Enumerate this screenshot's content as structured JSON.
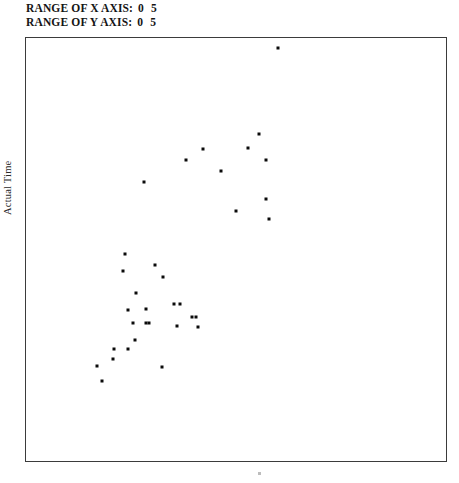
{
  "header": {
    "x_range": {
      "label": "RANGE OF X AXIS:",
      "min": "0",
      "max": "5"
    },
    "y_range": {
      "label": "RANGE OF Y AXIS:",
      "min": "0",
      "max": "5"
    }
  },
  "axes": {
    "y_title": "Actual Time",
    "x_title": ""
  },
  "chart_data": {
    "type": "scatter",
    "title": "",
    "xlabel": "",
    "ylabel": "Actual Time",
    "xlim": [
      0,
      5
    ],
    "ylim": [
      0,
      5
    ],
    "grid": false,
    "legend": null,
    "marker": {
      "shape": "square",
      "size_px": 3,
      "color": "#0b0b0b"
    },
    "n_points": 34,
    "points": [
      {
        "x": 3.0,
        "y": 4.88
      },
      {
        "x": 2.77,
        "y": 3.86
      },
      {
        "x": 2.64,
        "y": 3.7
      },
      {
        "x": 2.11,
        "y": 3.69
      },
      {
        "x": 2.86,
        "y": 3.56
      },
      {
        "x": 1.9,
        "y": 3.56
      },
      {
        "x": 2.32,
        "y": 3.43
      },
      {
        "x": 1.4,
        "y": 3.3
      },
      {
        "x": 2.86,
        "y": 3.1
      },
      {
        "x": 2.5,
        "y": 2.95
      },
      {
        "x": 2.89,
        "y": 2.86
      },
      {
        "x": 1.54,
        "y": 2.32
      },
      {
        "x": 1.15,
        "y": 2.25
      },
      {
        "x": 1.63,
        "y": 2.18
      },
      {
        "x": 1.31,
        "y": 1.98
      },
      {
        "x": 1.76,
        "y": 1.85
      },
      {
        "x": 1.83,
        "y": 1.85
      },
      {
        "x": 1.43,
        "y": 1.8
      },
      {
        "x": 1.98,
        "y": 1.7
      },
      {
        "x": 2.02,
        "y": 1.7
      },
      {
        "x": 1.27,
        "y": 1.63
      },
      {
        "x": 1.43,
        "y": 1.63
      },
      {
        "x": 1.47,
        "y": 1.63
      },
      {
        "x": 1.8,
        "y": 1.6
      },
      {
        "x": 2.05,
        "y": 1.58
      },
      {
        "x": 1.3,
        "y": 1.43
      },
      {
        "x": 1.05,
        "y": 1.32
      },
      {
        "x": 1.22,
        "y": 1.32
      },
      {
        "x": 1.04,
        "y": 1.21
      },
      {
        "x": 0.84,
        "y": 1.12
      },
      {
        "x": 1.62,
        "y": 1.11
      },
      {
        "x": 0.9,
        "y": 0.95
      },
      {
        "x": 1.22,
        "y": 1.79
      },
      {
        "x": 1.18,
        "y": 2.45
      }
    ]
  }
}
